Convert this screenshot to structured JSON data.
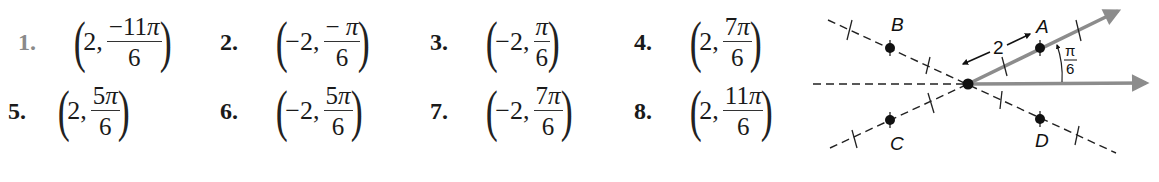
{
  "problems": [
    {
      "label": "1.",
      "r": "2,",
      "numerator_sign": "−",
      "numerator_coef": "11",
      "numerator_sym": "π",
      "denominator": "6",
      "label_style": "muted"
    },
    {
      "label": "2.",
      "r": "−2,",
      "numerator_sign": "− ",
      "numerator_coef": "",
      "numerator_sym": "π",
      "denominator": "6"
    },
    {
      "label": "3.",
      "r": "−2,",
      "numerator_sign": "",
      "numerator_coef": "",
      "numerator_sym": "π",
      "denominator": "6"
    },
    {
      "label": "4.",
      "r": "2,",
      "numerator_sign": "",
      "numerator_coef": "7",
      "numerator_sym": "π",
      "denominator": "6"
    },
    {
      "label": "5.",
      "r": "2,",
      "numerator_sign": "",
      "numerator_coef": "5",
      "numerator_sym": "π",
      "denominator": "6"
    },
    {
      "label": "6.",
      "r": "−2,",
      "numerator_sign": "",
      "numerator_coef": "5",
      "numerator_sym": "π",
      "denominator": "6"
    },
    {
      "label": "7.",
      "r": "−2,",
      "numerator_sign": "",
      "numerator_coef": "7",
      "numerator_sym": "π",
      "denominator": "6"
    },
    {
      "label": "8.",
      "r": "2,",
      "numerator_sign": "",
      "numerator_coef": "11",
      "numerator_sym": "π",
      "denominator": "6"
    }
  ],
  "diagram": {
    "point_labels": {
      "A": "A",
      "B": "B",
      "C": "C",
      "D": "D"
    },
    "distance_label": "2",
    "angle_label_num": "π",
    "angle_label_den": "6",
    "colors": {
      "ray": "#8c8c8c",
      "dash": "#222222",
      "point": "#111111"
    }
  }
}
